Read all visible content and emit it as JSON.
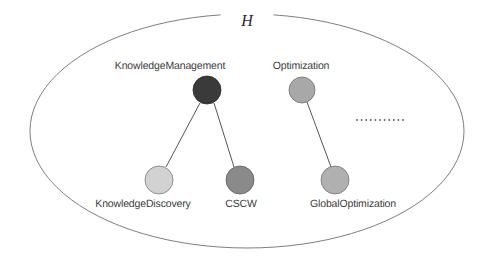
{
  "diagram": {
    "type": "node-link-diagram",
    "set_label": {
      "text": "H",
      "x": 247,
      "y": 12
    },
    "boundary": {
      "name": "outer-ellipse",
      "cx": 247,
      "cy": 131,
      "rx": 217,
      "ry": 117,
      "stroke": "#6f6f6f",
      "stroke_width": 0.9,
      "gap_start_deg": 263,
      "gap_end_deg": 277
    },
    "nodes": [
      {
        "id": "knowledge-management",
        "label": "KnowledgeManagement",
        "cx": 207,
        "cy": 90,
        "r": 14,
        "fill": "#3a3a3a",
        "stroke": "#2a2a2a",
        "label_x": 170,
        "label_y": 60,
        "label_position": "above"
      },
      {
        "id": "optimization",
        "label": "Optimization",
        "cx": 302,
        "cy": 90,
        "r": 13,
        "fill": "#a8a8a8",
        "stroke": "#707070",
        "label_x": 301,
        "label_y": 60,
        "label_position": "above"
      },
      {
        "id": "knowledge-discovery",
        "label": "KnowledgeDiscovery",
        "cx": 159,
        "cy": 180,
        "r": 14,
        "fill": "#d2d2d2",
        "stroke": "#7a7a7a",
        "label_x": 143,
        "label_y": 198,
        "label_position": "below"
      },
      {
        "id": "cscw",
        "label": "CSCW",
        "cx": 240,
        "cy": 180,
        "r": 14,
        "fill": "#8a8a8a",
        "stroke": "#5e5e5e",
        "label_x": 241,
        "label_y": 198,
        "label_position": "below"
      },
      {
        "id": "global-optimization",
        "label": "GlobalOptimization",
        "cx": 335,
        "cy": 180,
        "r": 14,
        "fill": "#b0b0b0",
        "stroke": "#757575",
        "label_x": 353,
        "label_y": 198,
        "label_position": "below"
      }
    ],
    "edges": [
      {
        "id": "edge-km-kd",
        "from": "knowledge-management",
        "to": "knowledge-discovery",
        "x1": 200,
        "y1": 103,
        "x2": 166,
        "y2": 167,
        "stroke": "#555555",
        "stroke_width": 1
      },
      {
        "id": "edge-km-cscw",
        "from": "knowledge-management",
        "to": "cscw",
        "x1": 214,
        "y1": 103,
        "x2": 234,
        "y2": 167,
        "stroke": "#555555",
        "stroke_width": 1
      },
      {
        "id": "edge-opt-globalopt",
        "from": "optimization",
        "to": "global-optimization",
        "x1": 307,
        "y1": 102,
        "x2": 331,
        "y2": 167,
        "stroke": "#555555",
        "stroke_width": 1
      }
    ],
    "ellipsis": {
      "id": "continuation-ellipsis",
      "dot_count": 11,
      "x_start": 357,
      "y": 120,
      "spacing": 4.6,
      "dot_radius": 0.9,
      "fill": "#5a5a5a"
    }
  }
}
